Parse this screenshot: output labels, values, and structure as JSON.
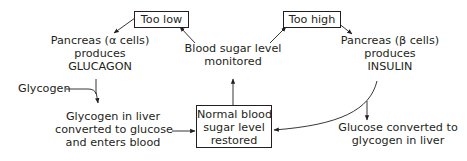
{
  "diagram": {
    "nodes": {
      "too_low": {
        "label": "Too low"
      },
      "too_high": {
        "label": "Too high"
      },
      "monitored": {
        "lines": [
          "Blood sugar level",
          "monitored"
        ]
      },
      "pancreas_alpha": {
        "lines": [
          "Pancreas (α cells)",
          "produces",
          "GLUCAGON"
        ]
      },
      "pancreas_beta": {
        "lines": [
          "Pancreas (β cells)",
          "produces",
          "INSULIN"
        ]
      },
      "glycogen": {
        "label": "Glycogen"
      },
      "liver_to_glucose": {
        "lines": [
          "Glycogen in liver",
          "converted to glucose",
          "and enters blood"
        ]
      },
      "normal": {
        "lines": [
          "Normal blood",
          "sugar level",
          "restored"
        ]
      },
      "glucose_to_glycogen": {
        "lines": [
          "Glucose converted to",
          "glycogen in liver"
        ]
      }
    },
    "edges": [
      {
        "from": "monitored",
        "to": "too_low"
      },
      {
        "from": "monitored",
        "to": "too_high"
      },
      {
        "from": "too_low",
        "to": "pancreas_alpha"
      },
      {
        "from": "too_high",
        "to": "pancreas_beta"
      },
      {
        "from": "pancreas_alpha",
        "to": "liver_to_glucose"
      },
      {
        "from": "glycogen",
        "to": "liver_to_glucose"
      },
      {
        "from": "liver_to_glucose",
        "to": "normal"
      },
      {
        "from": "pancreas_beta",
        "to": "normal"
      },
      {
        "from": "pancreas_beta",
        "to": "glucose_to_glycogen"
      },
      {
        "from": "normal",
        "to": "monitored"
      }
    ]
  }
}
